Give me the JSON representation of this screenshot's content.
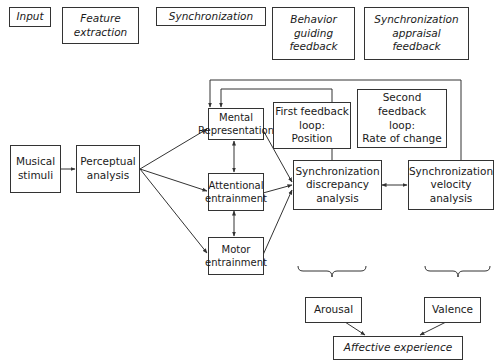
{
  "header_row": {
    "input": "Input",
    "feature_extraction": "Feature\nextraction",
    "synchronization": "Synchronization",
    "behavior_guiding_feedback": "Behavior\nguiding\nfeedback",
    "synchronization_appraisal_feedback": "Synchronization\nappraisal\nfeedback"
  },
  "nodes": {
    "musical_stimuli": "Musical\nstimuli",
    "perceptual_analysis": "Perceptual\nanalysis",
    "mental_representation": "Mental\nRepresentation",
    "attentional_entrainment": "Attentional\nentrainment",
    "motor_entrainment": "Motor\nentrainment",
    "first_feedback_loop": "First feedback\nloop:\nPosition",
    "second_feedback_loop": "Second feedback\nloop:\nRate of change",
    "synchronization_discrepancy_analysis": "Synchronization\ndiscrepancy\nanalysis",
    "synchronization_velocity_analysis": "Synchronization\nvelocity\nanalysis",
    "arousal": "Arousal",
    "valence": "Valence",
    "affective_experience": "Affective experience"
  },
  "colors": {
    "line": "#333333",
    "background": "#ffffff"
  }
}
